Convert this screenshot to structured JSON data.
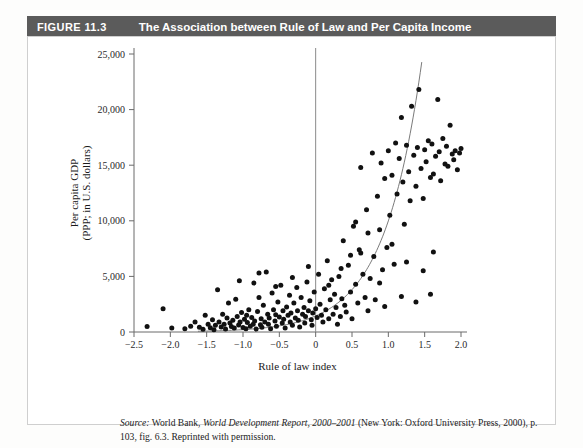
{
  "figure": {
    "number_label": "FIGURE 11.3",
    "title": "The Association between Rule of Law and Per Capita Income",
    "bar_color": "#5b5b5b",
    "bar_text_color": "#ffffff"
  },
  "source_note": {
    "label": "Source:",
    "text_before_title": " World Bank, ",
    "title": "World Development Report, 2000–2001",
    "text_after_title": " (New York: Oxford University Press, 2000), p. 103, fig. 6.3. Reprinted with permission."
  },
  "chart_data": {
    "type": "scatter",
    "title": "The Association between Rule of Law and Per Capita Income",
    "xlabel": "Rule of law index",
    "ylabel": "Per capita GDP\n(PPP; in U.S. dollars)",
    "ylabel_line1": "Per capita GDP",
    "ylabel_line2": "(PPP; in U.S. dollars)",
    "xlim": [
      -2.5,
      2.0
    ],
    "ylim": [
      0,
      25000
    ],
    "xticks": [
      -2.5,
      -2.0,
      -1.5,
      -1.0,
      -0.5,
      0,
      0.5,
      1.0,
      1.5,
      2.0
    ],
    "xticklabels": [
      "−2.5",
      "−2.0",
      "−1.5",
      "−1.0",
      "−0.5",
      "0",
      "0.5",
      "1.0",
      "1.5",
      "2.0"
    ],
    "yticks": [
      0,
      5000,
      10000,
      15000,
      20000,
      25000
    ],
    "yticklabels": [
      "0",
      "5,000",
      "10,000",
      "15,000",
      "20,000",
      "25,000"
    ],
    "grid": false,
    "legend": null,
    "annotations": [
      {
        "name": "zero-reference-line",
        "type": "vline",
        "x": 0
      }
    ],
    "series": [
      {
        "name": "Countries",
        "marker": "filled-circle",
        "color": "#111111",
        "points": [
          [
            -2.1,
            2100
          ],
          [
            -2.32,
            500
          ],
          [
            -1.98,
            350
          ],
          [
            -1.8,
            300
          ],
          [
            -1.72,
            520
          ],
          [
            -1.66,
            900
          ],
          [
            -1.6,
            420
          ],
          [
            -1.55,
            250
          ],
          [
            -1.52,
            1500
          ],
          [
            -1.48,
            700
          ],
          [
            -1.45,
            380
          ],
          [
            -1.42,
            1100
          ],
          [
            -1.4,
            200
          ],
          [
            -1.38,
            600
          ],
          [
            -1.35,
            3800
          ],
          [
            -1.33,
            900
          ],
          [
            -1.3,
            450
          ],
          [
            -1.28,
            1600
          ],
          [
            -1.26,
            700
          ],
          [
            -1.24,
            260
          ],
          [
            -1.22,
            1250
          ],
          [
            -1.2,
            2600
          ],
          [
            -1.18,
            800
          ],
          [
            -1.16,
            500
          ],
          [
            -1.14,
            1050
          ],
          [
            -1.12,
            350
          ],
          [
            -1.1,
            2950
          ],
          [
            -1.08,
            1400
          ],
          [
            -1.06,
            620
          ],
          [
            -1.04,
            900
          ],
          [
            -1.02,
            1750
          ],
          [
            -1.0,
            400
          ],
          [
            -0.98,
            1150
          ],
          [
            -0.96,
            300
          ],
          [
            -0.95,
            1500
          ],
          [
            -0.94,
            850
          ],
          [
            -0.92,
            2000
          ],
          [
            -0.9,
            520
          ],
          [
            -0.88,
            1300
          ],
          [
            -0.86,
            700
          ],
          [
            -0.85,
            4400
          ],
          [
            -0.84,
            1000
          ],
          [
            -0.82,
            260
          ],
          [
            -0.8,
            1850
          ],
          [
            -0.78,
            3100
          ],
          [
            -0.76,
            650
          ],
          [
            -0.75,
            1200
          ],
          [
            -0.74,
            430
          ],
          [
            -0.72,
            2400
          ],
          [
            -0.7,
            900
          ],
          [
            -0.68,
            5400
          ],
          [
            -0.66,
            1600
          ],
          [
            -0.65,
            700
          ],
          [
            -0.64,
            1250
          ],
          [
            -0.62,
            300
          ],
          [
            -0.6,
            3500
          ],
          [
            -0.58,
            2000
          ],
          [
            -0.56,
            1000
          ],
          [
            -0.55,
            1550
          ],
          [
            -0.54,
            520
          ],
          [
            -0.52,
            2700
          ],
          [
            -0.5,
            1350
          ],
          [
            -0.48,
            4200
          ],
          [
            -0.46,
            800
          ],
          [
            -0.45,
            1900
          ],
          [
            -0.44,
            1150
          ],
          [
            -0.42,
            350
          ],
          [
            -0.4,
            2250
          ],
          [
            -0.38,
            1500
          ],
          [
            -0.36,
            3300
          ],
          [
            -0.35,
            900
          ],
          [
            -0.34,
            1700
          ],
          [
            -0.32,
            600
          ],
          [
            -0.3,
            2600
          ],
          [
            -0.28,
            1250
          ],
          [
            -0.26,
            4000
          ],
          [
            -0.25,
            1900
          ],
          [
            -0.24,
            1050
          ],
          [
            -0.22,
            450
          ],
          [
            -0.2,
            3100
          ],
          [
            -0.18,
            1600
          ],
          [
            -0.16,
            2200
          ],
          [
            -0.15,
            800
          ],
          [
            -0.14,
            1400
          ],
          [
            -0.12,
            4500
          ],
          [
            -0.1,
            1900
          ],
          [
            -0.08,
            2800
          ],
          [
            -0.06,
            1100
          ],
          [
            -0.05,
            600
          ],
          [
            -0.04,
            1700
          ],
          [
            -0.02,
            3600
          ],
          [
            0.0,
            2100
          ],
          [
            0.02,
            1300
          ],
          [
            0.04,
            5200
          ],
          [
            0.06,
            2500
          ],
          [
            0.08,
            1500
          ],
          [
            0.1,
            900
          ],
          [
            0.12,
            3900
          ],
          [
            0.14,
            2000
          ],
          [
            0.16,
            6400
          ],
          [
            0.18,
            1200
          ],
          [
            0.2,
            2900
          ],
          [
            0.22,
            4700
          ],
          [
            0.24,
            1600
          ],
          [
            0.26,
            3400
          ],
          [
            0.28,
            2200
          ],
          [
            0.3,
            700
          ],
          [
            0.32,
            5000
          ],
          [
            0.34,
            1400
          ],
          [
            0.36,
            3000
          ],
          [
            0.38,
            8200
          ],
          [
            0.4,
            2400
          ],
          [
            0.42,
            1800
          ],
          [
            0.45,
            6000
          ],
          [
            0.48,
            3600
          ],
          [
            0.5,
            1200
          ],
          [
            0.52,
            9500
          ],
          [
            0.55,
            4300
          ],
          [
            0.58,
            2600
          ],
          [
            0.6,
            7400
          ],
          [
            0.62,
            14800
          ],
          [
            0.65,
            5200
          ],
          [
            0.68,
            3100
          ],
          [
            0.7,
            11000
          ],
          [
            0.72,
            8900
          ],
          [
            0.75,
            4800
          ],
          [
            0.78,
            16100
          ],
          [
            0.8,
            6800
          ],
          [
            0.82,
            2900
          ],
          [
            0.85,
            12200
          ],
          [
            0.88,
            9200
          ],
          [
            0.9,
            15200
          ],
          [
            0.92,
            5600
          ],
          [
            0.95,
            13800
          ],
          [
            0.98,
            7600
          ],
          [
            1.0,
            16300
          ],
          [
            1.02,
            10500
          ],
          [
            1.05,
            14100
          ],
          [
            1.08,
            6100
          ],
          [
            1.1,
            17000
          ],
          [
            1.12,
            12400
          ],
          [
            1.15,
            15600
          ],
          [
            1.18,
            19300
          ],
          [
            1.2,
            13500
          ],
          [
            1.22,
            9700
          ],
          [
            1.25,
            16800
          ],
          [
            1.28,
            14400
          ],
          [
            1.3,
            11800
          ],
          [
            1.32,
            20300
          ],
          [
            1.35,
            15900
          ],
          [
            1.38,
            13100
          ],
          [
            1.4,
            16600
          ],
          [
            1.42,
            21800
          ],
          [
            1.45,
            14700
          ],
          [
            1.48,
            12000
          ],
          [
            1.5,
            16400
          ],
          [
            1.52,
            15300
          ],
          [
            1.55,
            17200
          ],
          [
            1.58,
            13900
          ],
          [
            1.6,
            16900
          ],
          [
            1.62,
            14200
          ],
          [
            1.65,
            15800
          ],
          [
            1.68,
            20900
          ],
          [
            1.7,
            16200
          ],
          [
            1.72,
            13600
          ],
          [
            1.75,
            17400
          ],
          [
            1.78,
            15100
          ],
          [
            1.8,
            16700
          ],
          [
            1.82,
            14900
          ],
          [
            1.85,
            18600
          ],
          [
            1.88,
            16000
          ],
          [
            1.9,
            15500
          ],
          [
            1.92,
            16300
          ],
          [
            1.95,
            14600
          ],
          [
            1.98,
            16100
          ],
          [
            2.0,
            16500
          ],
          [
            0.48,
            6900
          ],
          [
            0.55,
            9900
          ],
          [
            0.62,
            7100
          ],
          [
            0.35,
            5700
          ],
          [
            0.18,
            4200
          ],
          [
            -0.1,
            5900
          ],
          [
            -0.32,
            4900
          ],
          [
            -0.55,
            4100
          ],
          [
            -0.78,
            5300
          ],
          [
            -1.05,
            4600
          ],
          [
            0.88,
            4400
          ],
          [
            1.05,
            7900
          ],
          [
            1.25,
            6300
          ],
          [
            1.48,
            5500
          ],
          [
            1.62,
            7200
          ],
          [
            0.72,
            1900
          ],
          [
            0.95,
            2300
          ],
          [
            1.18,
            3200
          ],
          [
            1.38,
            2700
          ],
          [
            1.58,
            3400
          ]
        ]
      }
    ],
    "fit": {
      "name": "exponential-trend",
      "type": "curve",
      "color": "#7a7a7a",
      "description": "Upward-sloping exponential fit rising from near 0 at x=-1.5 to about 24,000 at x=1.45"
    }
  }
}
